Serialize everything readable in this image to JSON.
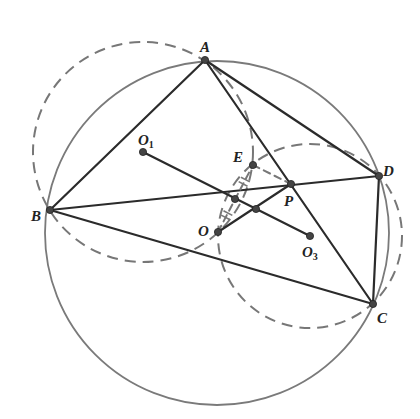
{
  "figure": {
    "colors": {
      "segment": "#2b2b2b",
      "circle": "#7a7a7a",
      "dashed": "#777777",
      "point": "#444444",
      "label": "#222222"
    },
    "points": {
      "A": {
        "x": 205,
        "y": 60
      },
      "B": {
        "x": 50,
        "y": 210
      },
      "C": {
        "x": 373,
        "y": 304
      },
      "D": {
        "x": 379,
        "y": 176
      },
      "O": {
        "x": 218,
        "y": 232
      },
      "O1": {
        "x": 143,
        "y": 152
      },
      "O3": {
        "x": 310,
        "y": 236
      },
      "E": {
        "x": 253,
        "y": 165
      },
      "P": {
        "x": 291,
        "y": 184
      },
      "M": {
        "x": 235,
        "y": 199
      },
      "Q": {
        "x": 256,
        "y": 209
      }
    },
    "circles": [
      {
        "name": "circumcircle-O",
        "cx": 217,
        "cy": 233,
        "r": 172,
        "style": "solid"
      },
      {
        "name": "circle-O1",
        "cx": 143,
        "cy": 152,
        "r": 110,
        "style": "dashed"
      },
      {
        "name": "circle-O3",
        "cx": 310,
        "cy": 236,
        "r": 92,
        "style": "dashed"
      }
    ],
    "segments": [
      {
        "from": "A",
        "to": "B",
        "style": "solid"
      },
      {
        "from": "A",
        "to": "D",
        "style": "solid"
      },
      {
        "from": "A",
        "to": "C",
        "style": "solid"
      },
      {
        "from": "B",
        "to": "D",
        "style": "solid"
      },
      {
        "from": "B",
        "to": "C",
        "style": "solid"
      },
      {
        "from": "D",
        "to": "C",
        "style": "solid"
      },
      {
        "from": "O1",
        "to": "O3",
        "style": "solid"
      },
      {
        "from": "O",
        "to": "P",
        "style": "solid"
      },
      {
        "from": "O",
        "to": "E",
        "style": "dashed"
      },
      {
        "from": "E",
        "to": "P",
        "style": "dashed"
      }
    ],
    "labels": {
      "A": {
        "text": "A",
        "sub": "",
        "x": 200,
        "y": 40
      },
      "B": {
        "text": "B",
        "sub": "",
        "x": 31,
        "y": 209
      },
      "C": {
        "text": "C",
        "sub": "",
        "x": 377,
        "y": 311
      },
      "D": {
        "text": "D",
        "sub": "",
        "x": 383,
        "y": 164
      },
      "O": {
        "text": "O",
        "sub": "",
        "x": 198,
        "y": 224
      },
      "O1": {
        "text": "O",
        "sub": "1",
        "x": 138,
        "y": 133
      },
      "O3": {
        "text": "O",
        "sub": "3",
        "x": 302,
        "y": 245
      },
      "E": {
        "text": "E",
        "sub": "",
        "x": 233,
        "y": 150
      },
      "P": {
        "text": "P",
        "sub": "",
        "x": 284,
        "y": 194
      }
    }
  }
}
